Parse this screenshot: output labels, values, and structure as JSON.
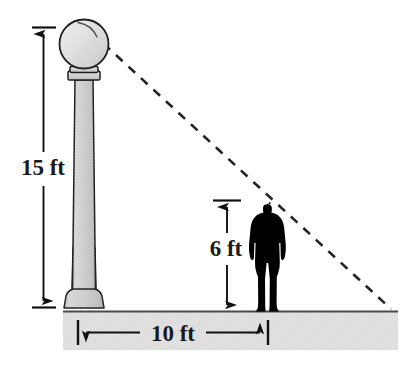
{
  "figure": {
    "background_color": "#ffffff",
    "width": 418,
    "height": 365,
    "ground": {
      "label": "ground-band",
      "fill_color": "#e3e3e3",
      "top_line_color": "#4d4d4d"
    },
    "lamppost": {
      "name": "lamppost",
      "globe_fill": "#dcdcdc",
      "shaft_fill": "#d2d2d2",
      "outline_color": "#1f1f1f",
      "height_label": "15 ft"
    },
    "person": {
      "name": "person-silhouette",
      "fill_color": "#000000",
      "height_label": "6 ft"
    },
    "sight_line": {
      "name": "dashed-sight-line",
      "style": "dashed",
      "color": "#2b2b2b"
    },
    "measurements": [
      {
        "id": "post-height",
        "label": "15 ft",
        "orientation": "vertical",
        "value": 15,
        "unit": "ft"
      },
      {
        "id": "person-height",
        "label": "6 ft",
        "orientation": "vertical",
        "value": 6,
        "unit": "ft"
      },
      {
        "id": "post-to-person-distance",
        "label": "10 ft",
        "orientation": "horizontal",
        "value": 10,
        "unit": "ft"
      }
    ],
    "labels": {
      "post_height": "15 ft",
      "person_height": "6 ft",
      "ground_distance": "10 ft"
    }
  }
}
